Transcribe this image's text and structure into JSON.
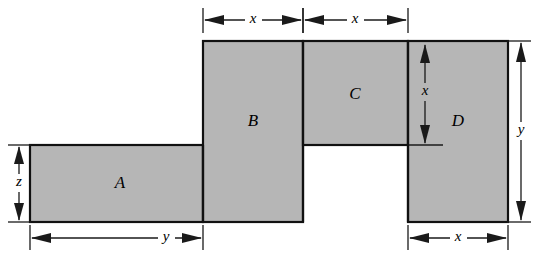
{
  "figure": {
    "background_color": "#ffffff",
    "fill_color": "#b6b6b6",
    "stroke_color": "#111111",
    "dimension_color": "#1a1a1a"
  },
  "regions": [
    {
      "id": "A",
      "label": "A",
      "label_x": 120,
      "label_y": 184
    },
    {
      "id": "B",
      "label": "B",
      "label_x": 253,
      "label_y": 122
    },
    {
      "id": "C",
      "label": "C",
      "label_x": 355,
      "label_y": 95
    },
    {
      "id": "D",
      "label": "D",
      "label_x": 458,
      "label_y": 122
    }
  ],
  "dimensions": [
    {
      "id": "top-left-x",
      "label": "x",
      "orientation": "horizontal",
      "label_x": 253,
      "label_y": 20
    },
    {
      "id": "top-right-x",
      "label": "x",
      "orientation": "horizontal",
      "label_x": 355,
      "label_y": 20
    },
    {
      "id": "left-z",
      "label": "z",
      "orientation": "vertical",
      "label_x": 19,
      "label_y": 183
    },
    {
      "id": "bottom-y",
      "label": "y",
      "orientation": "horizontal",
      "label_x": 166,
      "label_y": 238
    },
    {
      "id": "bottom-right-x",
      "label": "x",
      "orientation": "horizontal",
      "label_x": 458,
      "label_y": 238
    },
    {
      "id": "right-y",
      "label": "y",
      "orientation": "vertical",
      "label_x": 521,
      "label_y": 131
    },
    {
      "id": "inner-d-x",
      "label": "x",
      "orientation": "vertical",
      "label_x": 425,
      "label_y": 92
    }
  ]
}
